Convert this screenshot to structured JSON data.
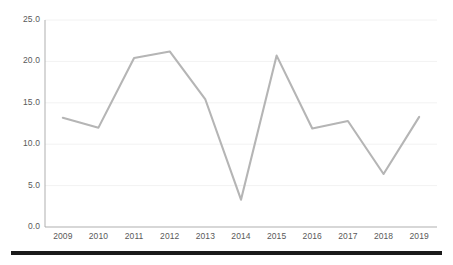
{
  "chart_data": {
    "type": "line",
    "title": "",
    "subtitle": "",
    "xlabel": "",
    "ylabel": "",
    "categories": [
      "2009",
      "2010",
      "2011",
      "2012",
      "2013",
      "2014",
      "2015",
      "2016",
      "2017",
      "2018",
      "2019"
    ],
    "values": [
      13.2,
      12.0,
      20.4,
      21.2,
      15.4,
      3.3,
      20.7,
      11.9,
      12.8,
      6.4,
      13.3
    ],
    "series": [
      {
        "name": "",
        "values": [
          13.2,
          12.0,
          20.4,
          21.2,
          15.4,
          3.3,
          20.7,
          11.9,
          12.8,
          6.4,
          13.3
        ],
        "color": "#b5b5b5"
      }
    ],
    "ylim": [
      0.0,
      25.0
    ],
    "ytick_labels": [
      "0.0",
      "5.0",
      "10.0",
      "15.0",
      "20.0",
      "25.0"
    ],
    "ytick_values": [
      0.0,
      5.0,
      10.0,
      15.0,
      20.0,
      25.0
    ],
    "xtick_labels": [
      "2009",
      "2010",
      "2011",
      "2012",
      "2013",
      "2014",
      "2015",
      "2016",
      "2017",
      "2018",
      "2019"
    ],
    "grid": "horizontal",
    "legend": "none",
    "markers": "none",
    "annotations": [],
    "colors": {
      "line": "#b5b5b5",
      "grid": "#f2f2f2",
      "axis": "#a6a6a6",
      "tick_text": "#595959",
      "background": "#ffffff",
      "bottom_rule": "#1a1a1a"
    }
  },
  "geometry": {
    "plot_left": 45,
    "plot_right": 437,
    "plot_top": 20,
    "plot_bottom": 227
  }
}
